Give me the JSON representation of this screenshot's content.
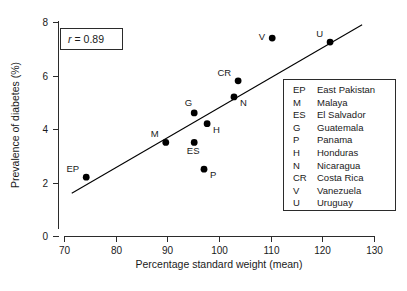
{
  "figure": {
    "width": 407,
    "height": 291,
    "background": "#ffffff"
  },
  "annotation": {
    "stat_symbol": "r",
    "stat_equals": "= 0.89",
    "stat_full": "r = 0.89"
  },
  "legend": {
    "title": "",
    "entries": [
      {
        "code": "EP",
        "name": "East Pakistan"
      },
      {
        "code": "M",
        "name": "Malaya"
      },
      {
        "code": "ES",
        "name": "El Salvador"
      },
      {
        "code": "G",
        "name": "Guatemala"
      },
      {
        "code": "P",
        "name": "Panama"
      },
      {
        "code": "H",
        "name": "Honduras"
      },
      {
        "code": "N",
        "name": "Nicaragua"
      },
      {
        "code": "CR",
        "name": "Costa Rica"
      },
      {
        "code": "V",
        "name": "Vanezuela"
      },
      {
        "code": "U",
        "name": "Uruguay"
      }
    ]
  },
  "chart_data": {
    "type": "scatter",
    "title": "",
    "xlabel": "Percentage standard weight (mean)",
    "ylabel": "Prevalence of diabetes (%)",
    "xlim": [
      70,
      130
    ],
    "ylim": [
      0,
      8
    ],
    "xticks": [
      70,
      80,
      90,
      100,
      110,
      120,
      130
    ],
    "yticks": [
      0,
      2,
      4,
      6,
      8
    ],
    "grid": false,
    "legend_position": "inside-right",
    "point_color": "#000000",
    "line_color": "#000000",
    "annotations": [
      "r = 0.89"
    ],
    "points": [
      {
        "label": "EP",
        "name": "East Pakistan",
        "x": 74.3,
        "y": 2.2,
        "label_pos": "left-above"
      },
      {
        "label": "M",
        "name": "Malaya",
        "x": 89.7,
        "y": 3.5,
        "label_pos": "left-above"
      },
      {
        "label": "ES",
        "name": "El Salvador",
        "x": 95.2,
        "y": 3.5,
        "label_pos": "below-left"
      },
      {
        "label": "G",
        "name": "Guatemala",
        "x": 95.2,
        "y": 4.6,
        "label_pos": "above-left"
      },
      {
        "label": "H",
        "name": "Honduras",
        "x": 97.7,
        "y": 4.2,
        "label_pos": "right-below"
      },
      {
        "label": "P",
        "name": "Panama",
        "x": 97.1,
        "y": 2.5,
        "label_pos": "right-below"
      },
      {
        "label": "N",
        "name": "Nicaragua",
        "x": 102.9,
        "y": 5.2,
        "label_pos": "right-below"
      },
      {
        "label": "CR",
        "name": "Costa Rica",
        "x": 103.7,
        "y": 5.8,
        "label_pos": "left-above"
      },
      {
        "label": "V",
        "name": "Vanezuela",
        "x": 110.3,
        "y": 7.4,
        "label_pos": "left"
      },
      {
        "label": "U",
        "name": "Uruguay",
        "x": 121.5,
        "y": 7.25,
        "label_pos": "left-above"
      }
    ],
    "fit_line": {
      "x_start": 71.5,
      "y_start": 1.6,
      "x_end": 127.7,
      "y_end": 7.9
    }
  }
}
